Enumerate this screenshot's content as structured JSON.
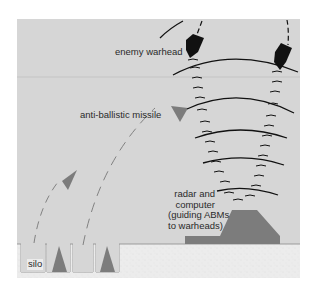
{
  "colors": {
    "sky": "#d6d6d6",
    "ground": "#ececec",
    "shape_gray": "#7c7c7c",
    "warhead": "#111111",
    "wave": "#111111"
  },
  "labels": {
    "enemy_warhead": "enemy warhead",
    "anti_ballistic_missile": "anti-ballistic missile",
    "radar_line1": "radar and",
    "radar_line2": "computer",
    "radar_line3": "(guiding ABMs",
    "radar_line4": "to warheads)",
    "silo": "silo"
  }
}
